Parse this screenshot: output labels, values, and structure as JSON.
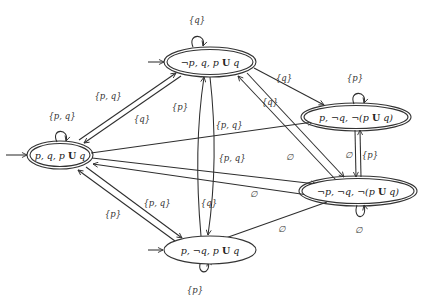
{
  "diagram": {
    "type": "buchi-automaton",
    "nodes": [
      {
        "id": "n0",
        "label_parts": [
          "p, q, p ",
          "U",
          " q"
        ],
        "accepting": true,
        "initial": true
      },
      {
        "id": "n1",
        "label_parts": [
          "¬p, q, p ",
          "U",
          " q"
        ],
        "accepting": true,
        "initial": true
      },
      {
        "id": "n2",
        "label_parts": [
          "p, ¬q, ¬(p ",
          "U",
          " q)"
        ],
        "accepting": true,
        "initial": false
      },
      {
        "id": "n3",
        "label_parts": [
          "¬p, ¬q, ¬(p ",
          "U",
          " q)"
        ],
        "accepting": true,
        "initial": false
      },
      {
        "id": "n4",
        "label_parts": [
          "p, ¬q, p ",
          "U",
          " q"
        ],
        "accepting": false,
        "initial": true
      }
    ],
    "edge_labels": {
      "loop_n0": "{p, q}",
      "loop_n1": "{q}",
      "loop_n2": "{p}",
      "loop_n3": "∅",
      "loop_n4": "{p}",
      "n0_n1": "{p, q}",
      "n1_n0": "{q}",
      "n0_n2": "{p, q}",
      "n0_n3": "{p, q}",
      "n3_n0": "∅",
      "n0_n4": "{p, q}",
      "n4_n0": "{p}",
      "n1_n2": "{q}",
      "n1_n3": "{q}",
      "n3_n1": "∅",
      "n4_n1": "{p}",
      "n1_n4": "{q}",
      "n2_n3": "∅",
      "n3_n2": "{p}",
      "n3_n4": "∅"
    }
  }
}
